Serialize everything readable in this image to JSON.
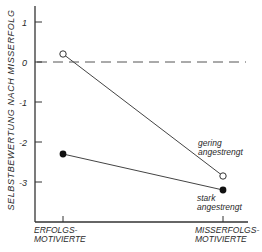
{
  "chart_data": {
    "type": "line",
    "title": "",
    "xlabel": "",
    "ylabel": "SELBSTBEWERTUNG NACH MISSERFOLG",
    "categories": [
      "ERFOLGS-\nMOTIVIERTE",
      "MISSERFOLGS-\nMOTIVIERTE"
    ],
    "category_lines": [
      [
        "ERFOLGS-",
        "MOTIVIERTE"
      ],
      [
        "MISSERFOLGS-",
        "MOTIVIERTE"
      ]
    ],
    "series": [
      {
        "name": "gering angestrengt",
        "label_lines": [
          "gering",
          "angestrengt"
        ],
        "marker": "open-circle",
        "values": [
          0.2,
          -2.85
        ]
      },
      {
        "name": "stark angestrengt",
        "label_lines": [
          "stark",
          "angestrengt"
        ],
        "marker": "filled-circle",
        "values": [
          -2.3,
          -3.2
        ]
      }
    ],
    "yticks": [
      1,
      0,
      -1,
      -2,
      -3
    ],
    "ytick_labels": [
      "1",
      "0",
      "-1",
      "-2",
      "-3"
    ],
    "ylim": [
      -4,
      1.5
    ],
    "reference_line": {
      "y": 0,
      "style": "dashed"
    },
    "grid": false,
    "legend": "inline labels near right-hand points"
  }
}
